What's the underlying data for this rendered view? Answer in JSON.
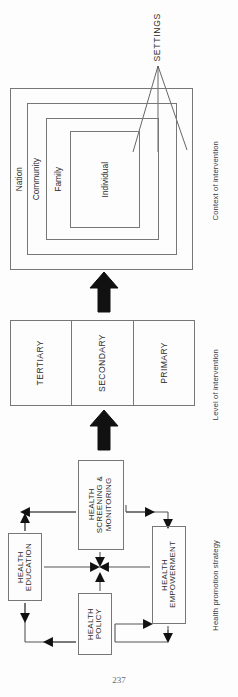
{
  "page": {
    "number": "237",
    "orientation": "rotated-90",
    "background_color": "#fdfdfd",
    "line_color": "#777777",
    "text_color": "#2b2b2b"
  },
  "columns": [
    {
      "caption": "Context of intervention"
    },
    {
      "caption": "Level of intervention"
    },
    {
      "caption": "Health promotion strategy"
    }
  ],
  "context": {
    "annotation": "SETTINGS",
    "nested_boxes": [
      {
        "label": "Nation"
      },
      {
        "label": "Community"
      },
      {
        "label": "Family"
      },
      {
        "label": "Individual"
      }
    ],
    "leader_lines": 3
  },
  "level": {
    "cells": [
      {
        "label": "TERTIARY"
      },
      {
        "label": "SECONDARY"
      },
      {
        "label": "PRIMARY"
      }
    ]
  },
  "strategy": {
    "boxes": [
      {
        "id": "education",
        "label": "HEALTH\nEDUCATION"
      },
      {
        "id": "screening",
        "label": "HEALTH\nSCREENING &\nMONITORING"
      },
      {
        "id": "policy",
        "label": "HEALTH\nPOLICY"
      },
      {
        "id": "empowerment",
        "label": "HEALTH\nEMPOWERMENT"
      }
    ]
  },
  "flow_arrows": {
    "strategy_to_level": "big-arrow-up",
    "level_to_context": "big-arrow-up"
  }
}
